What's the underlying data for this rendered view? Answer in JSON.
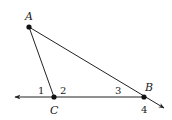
{
  "diagram": {
    "type": "geometry-triangle",
    "points": [
      {
        "label": "A",
        "x": 29,
        "y": 27,
        "lx": 27,
        "ly": 19
      },
      {
        "label": "B",
        "x": 144,
        "y": 97,
        "lx": 148,
        "ly": 90
      },
      {
        "label": "C",
        "x": 54,
        "y": 97,
        "lx": 54,
        "ly": 113
      }
    ],
    "angles": [
      {
        "label": "1",
        "x": 41,
        "y": 94
      },
      {
        "label": "2",
        "x": 63,
        "y": 94
      },
      {
        "label": "3",
        "x": 118,
        "y": 94
      },
      {
        "label": "4",
        "x": 144,
        "y": 113
      }
    ],
    "line_color": "#222222"
  }
}
